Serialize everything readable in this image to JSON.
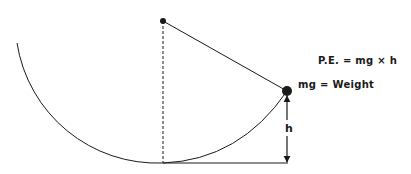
{
  "diagram": {
    "labels": {
      "potential_energy_formula": "P.E. = mg × h",
      "weight_definition": "mg = Weight",
      "height": "h"
    },
    "elements": {
      "pivot": {
        "x": 163,
        "y": 21
      },
      "bob": {
        "x": 287,
        "y": 91
      },
      "lowest_point": {
        "x": 163,
        "y": 163
      },
      "baseline_end": {
        "x": 288,
        "y": 163
      },
      "arc_left_start": {
        "x": 17,
        "y": 43
      }
    },
    "colors": {
      "stroke": "#1a1a1a",
      "background": "#ffffff"
    }
  }
}
